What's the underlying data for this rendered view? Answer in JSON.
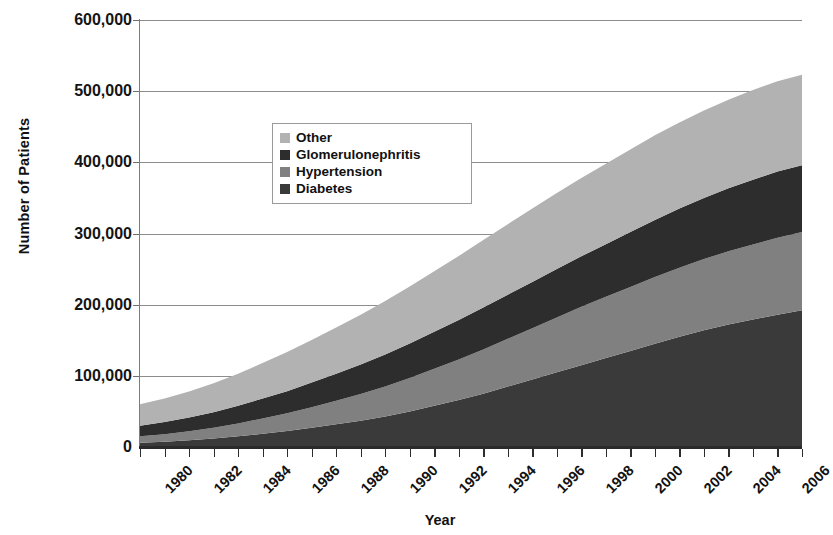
{
  "chart_data": {
    "type": "area",
    "title": "",
    "xlabel": "Year",
    "ylabel": "Number of Patients",
    "stacked": true,
    "grid": true,
    "legend_position": "inside-upper-center",
    "xlim": [
      1980,
      2007
    ],
    "ylim": [
      0,
      600000
    ],
    "ytick_labels": [
      "600,000",
      "500,000",
      "400,000",
      "300,000",
      "200,000",
      "100,000",
      "0"
    ],
    "ytick_values": [
      600000,
      500000,
      400000,
      300000,
      200000,
      100000,
      0
    ],
    "xtick_labels": [
      "1980",
      "1982",
      "1984",
      "1986",
      "1988",
      "1990",
      "1992",
      "1994",
      "1996",
      "1998",
      "2000",
      "2002",
      "2004",
      "2006"
    ],
    "xtick_values": [
      1980,
      1982,
      1984,
      1986,
      1988,
      1990,
      1992,
      1994,
      1996,
      1998,
      2000,
      2002,
      2004,
      2006
    ],
    "x": [
      1980,
      1981,
      1982,
      1983,
      1984,
      1985,
      1986,
      1987,
      1988,
      1989,
      1990,
      1991,
      1992,
      1993,
      1994,
      1995,
      1996,
      1997,
      1998,
      1999,
      2000,
      2001,
      2002,
      2003,
      2004,
      2005,
      2006,
      2007
    ],
    "series": [
      {
        "name": "Diabetes",
        "color": "#3a3a3a",
        "values": [
          6000,
          7500,
          9500,
          12000,
          15000,
          18500,
          22500,
          27000,
          32000,
          37000,
          43000,
          50000,
          58000,
          66000,
          75000,
          85000,
          95000,
          105000,
          115000,
          125000,
          135000,
          145000,
          155000,
          164000,
          172000,
          179000,
          186000,
          192000
        ]
      },
      {
        "name": "Hypertension",
        "color": "#808080",
        "values": [
          9000,
          10500,
          12500,
          15000,
          18000,
          21500,
          25000,
          29000,
          33000,
          37500,
          42000,
          47000,
          52000,
          57000,
          62000,
          67000,
          72000,
          77000,
          82000,
          86000,
          90000,
          94000,
          97000,
          100000,
          103000,
          105500,
          108000,
          110000
        ]
      },
      {
        "name": "Glomerulonephritis",
        "color": "#2d2d2d",
        "values": [
          15000,
          17000,
          19500,
          22000,
          25000,
          28000,
          31000,
          34500,
          38000,
          41500,
          45000,
          48500,
          52000,
          55500,
          59000,
          62000,
          65000,
          68000,
          71000,
          74000,
          77000,
          80000,
          83000,
          86000,
          88500,
          91000,
          93000,
          94000
        ]
      },
      {
        "name": "Other",
        "color": "#b2b2b2",
        "values": [
          30000,
          33000,
          36500,
          40500,
          45000,
          50000,
          55000,
          60000,
          65000,
          70000,
          75000,
          80000,
          85000,
          90000,
          95000,
          99000,
          103000,
          107000,
          110000,
          113000,
          116000,
          119000,
          121000,
          123000,
          124500,
          126000,
          127000,
          127000
        ]
      }
    ],
    "totals": [
      60000,
      68000,
      78000,
      89500,
      103000,
      118000,
      133500,
      150500,
      168000,
      186000,
      205000,
      225500,
      247000,
      268500,
      291000,
      313000,
      335000,
      357000,
      378000,
      398000,
      418000,
      438000,
      456000,
      473000,
      488000,
      501500,
      514000,
      523000
    ]
  },
  "legend": {
    "items": [
      {
        "label": "Other",
        "color": "#b2b2b2"
      },
      {
        "label": "Glomerulonephritis",
        "color": "#2d2d2d"
      },
      {
        "label": "Hypertension",
        "color": "#808080"
      },
      {
        "label": "Diabetes",
        "color": "#3a3a3a"
      }
    ]
  },
  "axes": {
    "y_title": "Number of Patients",
    "x_title": "Year"
  }
}
